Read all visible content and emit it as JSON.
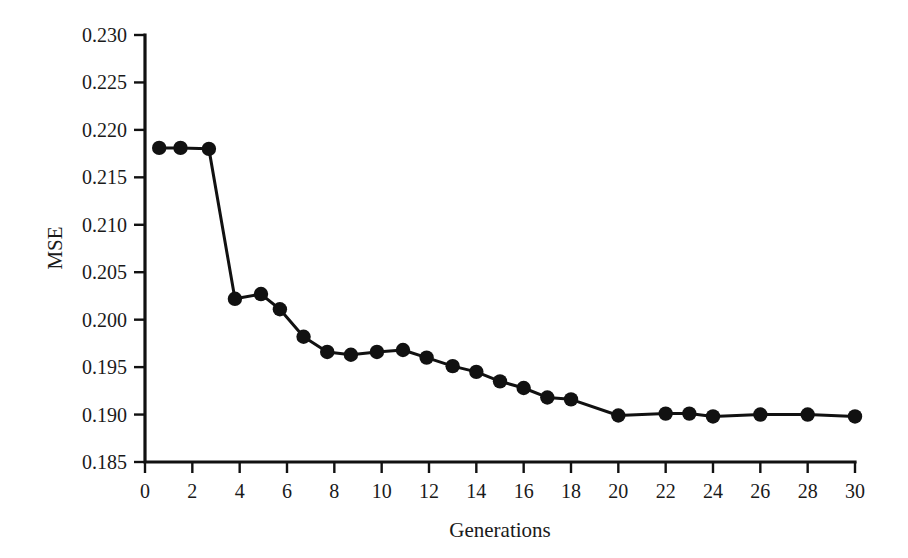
{
  "chart_data": {
    "type": "line",
    "title": "",
    "subtitle": "",
    "xlabel": "Generations",
    "ylabel": "MSE",
    "xlim": [
      0,
      30
    ],
    "ylim": [
      0.185,
      0.23
    ],
    "xticks": [
      0,
      2,
      4,
      6,
      8,
      10,
      12,
      14,
      16,
      18,
      20,
      22,
      24,
      26,
      28,
      30
    ],
    "xtick_labels": [
      "0",
      "2",
      "4",
      "6",
      "8",
      "10",
      "12",
      "14",
      "16",
      "18",
      "20",
      "22",
      "24",
      "26",
      "28",
      "30"
    ],
    "yticks": [
      0.185,
      0.19,
      0.195,
      0.2,
      0.205,
      0.21,
      0.215,
      0.22,
      0.225,
      0.23
    ],
    "ytick_labels": [
      "0.185",
      "0.190",
      "0.195",
      "0.200",
      "0.205",
      "0.210",
      "0.215",
      "0.220",
      "0.225",
      "0.230"
    ],
    "grid": false,
    "legend": false,
    "legend_position": "none",
    "marker": "circle",
    "marker_color": "#111111",
    "line_color": "#111111",
    "series": [
      {
        "name": "MSE",
        "x": [
          0.6,
          1.5,
          2.7,
          3.8,
          4.9,
          5.7,
          6.7,
          7.7,
          8.7,
          9.8,
          10.9,
          11.9,
          13.0,
          14.0,
          15.0,
          16.0,
          17.0,
          18.0,
          20.0,
          22.0,
          23.0,
          24.0,
          26.0,
          28.0,
          30.0
        ],
        "y": [
          0.2181,
          0.2181,
          0.218,
          0.2022,
          0.2027,
          0.2011,
          0.1982,
          0.1966,
          0.1963,
          0.1966,
          0.1968,
          0.196,
          0.1951,
          0.1945,
          0.1935,
          0.1928,
          0.1918,
          0.1916,
          0.1899,
          0.1901,
          0.1901,
          0.1898,
          0.19,
          0.19,
          0.1898
        ]
      }
    ]
  },
  "figure": {
    "background_color": "#ffffff",
    "foreground_color": "#111111"
  }
}
